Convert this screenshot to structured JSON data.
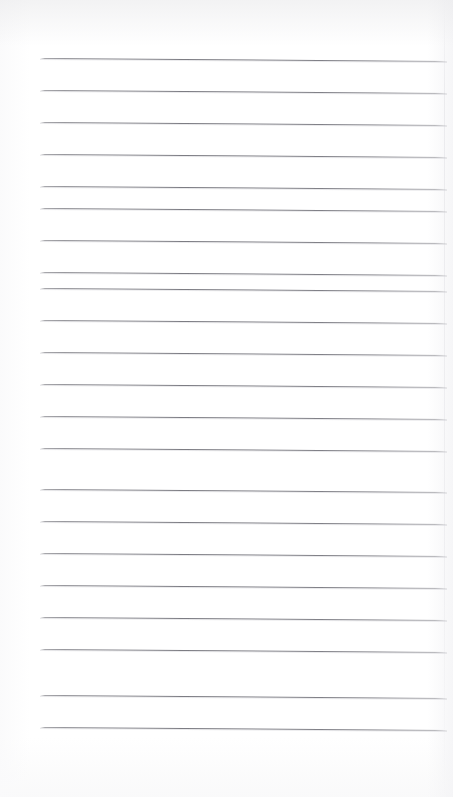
{
  "document": {
    "kind": "scanned-lined-paper",
    "title": "Blank Ruled Notebook Page",
    "page_width": 453,
    "page_height": 797,
    "background_color": "#ffffff",
    "rule_color": "#7a7a81",
    "content_text": ""
  },
  "ruling": {
    "line_count": 22,
    "first_line_y": 58,
    "line_spacing": 32.1,
    "line_left_x": 40,
    "line_right_x": 447,
    "line_thickness": 1,
    "skew_px": 3,
    "top_margin_label": "top margin",
    "bottom_margin_label": "bottom margin",
    "left_margin_label": "left margin"
  },
  "lines": [
    {
      "index": 1,
      "y": 58,
      "left": 40,
      "right": 447
    },
    {
      "index": 2,
      "y": 90,
      "left": 40,
      "right": 447
    },
    {
      "index": 3,
      "y": 122,
      "left": 40,
      "right": 447
    },
    {
      "index": 4,
      "y": 154,
      "left": 40,
      "right": 447
    },
    {
      "index": 5,
      "y": 186,
      "left": 40,
      "right": 447
    },
    {
      "index": 6,
      "y": 208,
      "left": 40,
      "right": 447
    },
    {
      "index": 7,
      "y": 240,
      "left": 40,
      "right": 447
    },
    {
      "index": 8,
      "y": 272,
      "left": 40,
      "right": 447
    },
    {
      "index": 9,
      "y": 288,
      "left": 40,
      "right": 447
    },
    {
      "index": 10,
      "y": 320,
      "left": 40,
      "right": 447
    },
    {
      "index": 11,
      "y": 352,
      "left": 40,
      "right": 447
    },
    {
      "index": 12,
      "y": 384,
      "left": 40,
      "right": 447
    },
    {
      "index": 13,
      "y": 416,
      "left": 40,
      "right": 447
    },
    {
      "index": 14,
      "y": 448,
      "left": 40,
      "right": 447
    },
    {
      "index": 15,
      "y": 489,
      "left": 40,
      "right": 447
    },
    {
      "index": 16,
      "y": 521,
      "left": 40,
      "right": 447
    },
    {
      "index": 17,
      "y": 553,
      "left": 40,
      "right": 447
    },
    {
      "index": 18,
      "y": 585,
      "left": 40,
      "right": 447
    },
    {
      "index": 19,
      "y": 617,
      "left": 40,
      "right": 447
    },
    {
      "index": 20,
      "y": 649,
      "left": 40,
      "right": 447
    },
    {
      "index": 21,
      "y": 695,
      "left": 40,
      "right": 447
    },
    {
      "index": 22,
      "y": 727,
      "left": 40,
      "right": 447
    }
  ],
  "artifacts": [
    {
      "name": "scan-dropout-upper",
      "x": 330,
      "y": 318,
      "width": 52
    },
    {
      "name": "scan-dropout-lower",
      "x": 352,
      "y": 350,
      "width": 42
    }
  ]
}
